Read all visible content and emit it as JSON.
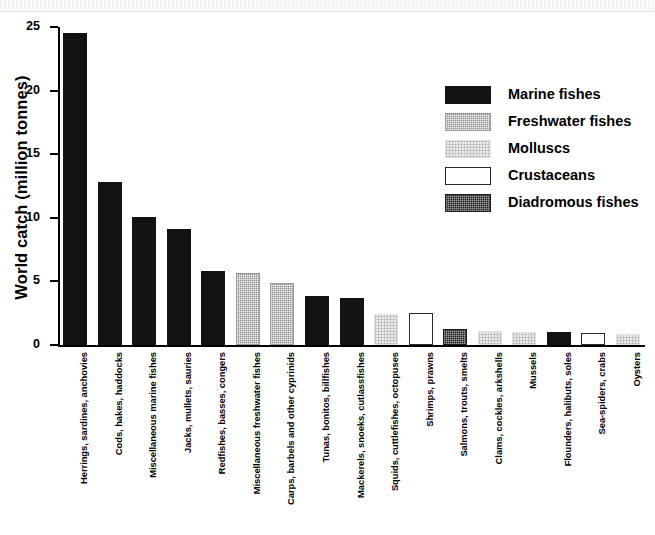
{
  "chart_data": {
    "type": "bar",
    "title": "",
    "xlabel": "",
    "ylabel": "World catch (million tonnes)",
    "ylim": [
      0,
      25
    ],
    "yticks": [
      "0",
      "5",
      "10",
      "15",
      "20",
      "25"
    ],
    "ytick_values": [
      0,
      5,
      10,
      15,
      20,
      25
    ],
    "grid": false,
    "legend_position": "upper-right",
    "categories": [
      "Herrings, sardines, anchovies",
      "Cods, hakes, haddocks",
      "Miscellaneous marine fishes",
      "Jacks, mullets, sauries",
      "Redfishes, basses, congers",
      "Miscellaneous freshwater fishes",
      "Carps, barbels and other cyprinids",
      "Tunas, bonitos, billfishes",
      "Mackerels, snoeks, cutlassfishes",
      "Squids, cuttlefishes, octopuses",
      "Shrimps, prawns",
      "Salmons, trouts, smelts",
      "Clams, cockles, arkshells",
      "Mussels",
      "Flounders, halibuts, soles",
      "Sea-spiders, crabs",
      "Oysters"
    ],
    "values": [
      24.5,
      12.8,
      10.1,
      9.1,
      5.8,
      5.7,
      4.9,
      3.85,
      3.7,
      2.4,
      2.5,
      1.25,
      1.1,
      1.0,
      1.0,
      0.95,
      0.85
    ],
    "groups": [
      "marine",
      "marine",
      "marine",
      "marine",
      "marine",
      "freshwater",
      "freshwater",
      "marine",
      "marine",
      "molluscs",
      "crustaceans",
      "diadromous",
      "molluscs",
      "molluscs",
      "marine",
      "crustaceans",
      "molluscs"
    ]
  },
  "legend": {
    "items": [
      {
        "label": "Marine fishes",
        "key": "marine",
        "color": "#131313"
      },
      {
        "label": "Freshwater fishes",
        "key": "freshwater",
        "color": "#8d8d8d"
      },
      {
        "label": "Molluscs",
        "key": "molluscs",
        "color": "#ededed"
      },
      {
        "label": "Crustaceans",
        "key": "crustaceans",
        "color": "#ffffff"
      },
      {
        "label": "Diadromous fishes",
        "key": "diadromous",
        "color": "#232323"
      }
    ]
  }
}
